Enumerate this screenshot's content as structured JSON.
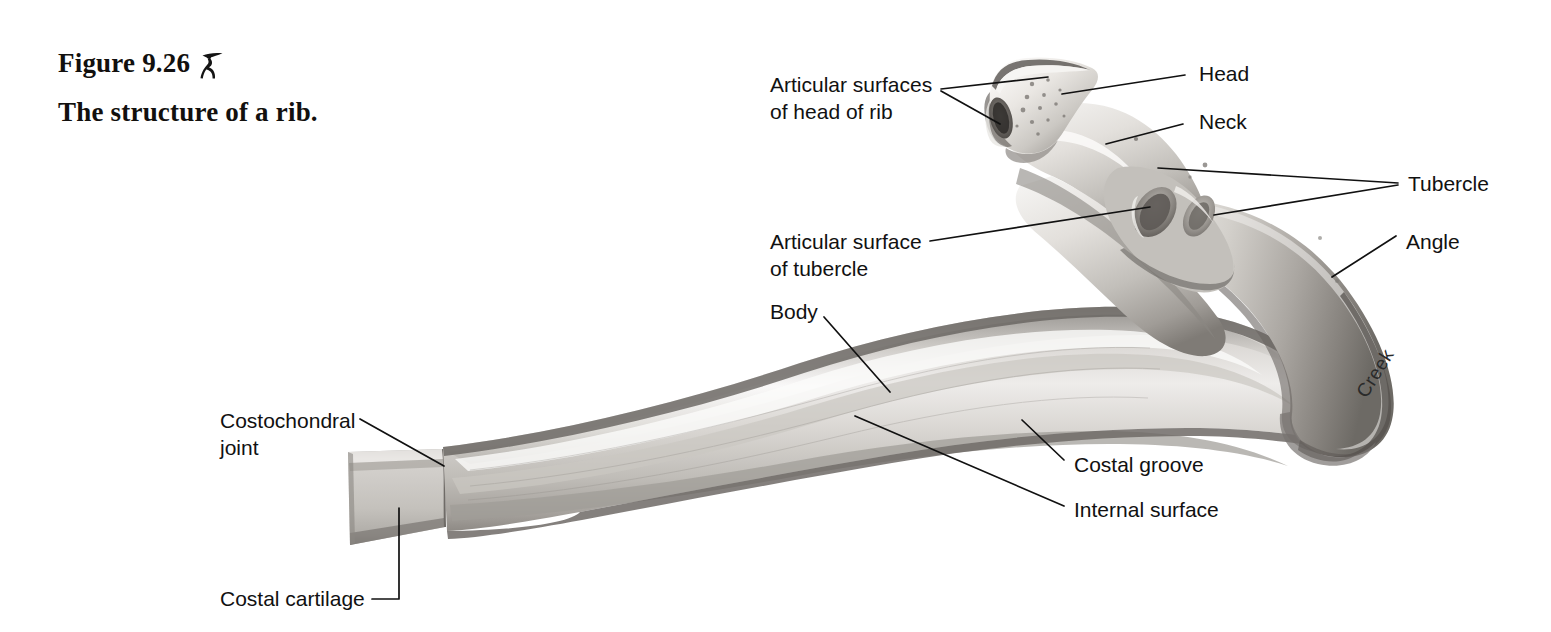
{
  "figure": {
    "number_text": "Figure 9.26",
    "icon_name": "focus-figure-runner-icon",
    "title": "The structure of a rib.",
    "signature": "Creek",
    "background_color": "#ffffff",
    "text_color": "#111111",
    "bone_light": "#f2f0ee",
    "bone_mid": "#c9c6c2",
    "bone_dark": "#8a8681",
    "cartilage_color": "#c3c1bd"
  },
  "labels": {
    "articular_surfaces_head": "Articular surfaces\nof head of rib",
    "head": "Head",
    "neck": "Neck",
    "tubercle": "Tubercle",
    "angle": "Angle",
    "articular_surface_tubercle": "Articular surface\nof tubercle",
    "body": "Body",
    "costochondral_joint": "Costochondral\njoint",
    "costal_cartilage": "Costal cartilage",
    "costal_groove": "Costal groove",
    "internal_surface": "Internal surface"
  },
  "anatomy_parts": [
    {
      "id": "articular-surfaces-of-head",
      "label": "Articular surfaces of head of rib",
      "side": "left"
    },
    {
      "id": "head",
      "label": "Head",
      "side": "right"
    },
    {
      "id": "neck",
      "label": "Neck",
      "side": "right"
    },
    {
      "id": "tubercle",
      "label": "Tubercle",
      "side": "right"
    },
    {
      "id": "angle",
      "label": "Angle",
      "side": "right"
    },
    {
      "id": "articular-surface-of-tubercle",
      "label": "Articular surface of tubercle",
      "side": "left"
    },
    {
      "id": "body",
      "label": "Body",
      "side": "left"
    },
    {
      "id": "costochondral-joint",
      "label": "Costochondral joint",
      "side": "left"
    },
    {
      "id": "costal-cartilage",
      "label": "Costal cartilage",
      "side": "left"
    },
    {
      "id": "costal-groove",
      "label": "Costal groove",
      "side": "right"
    },
    {
      "id": "internal-surface",
      "label": "Internal surface",
      "side": "right"
    }
  ]
}
